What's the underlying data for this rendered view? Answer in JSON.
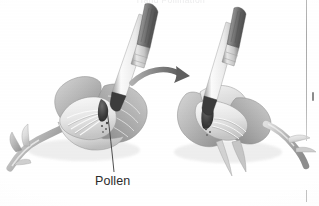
{
  "figure": {
    "medium": "grayscale scanned textbook illustration",
    "clipped_caption_top": "Hand Pollination",
    "background_color": "#ffffff",
    "ink_color": "#2b2b2b"
  },
  "labels": {
    "pollen": "Pollen"
  },
  "panels": [
    {
      "id": "left-flower",
      "name": "flower-cross-section-with-brush-collecting-pollen",
      "description": "Cut-away flower with brush inserted, stamens and pollen visible"
    },
    {
      "id": "right-flower",
      "name": "flower-cross-section-with-brush-depositing-pollen",
      "description": "Second cut-away flower receiving pollen from the brush"
    }
  ],
  "arrow": {
    "name": "transfer-arrow",
    "direction": "left-to-right",
    "color": "#8a8a8a"
  },
  "leader_line": {
    "name": "pollen-leader-line",
    "from": "pollen label",
    "to": "anther inside left flower",
    "color": "#3a3a3a"
  },
  "page_marks": {
    "rule_color": "#b4b4b4",
    "tick_color": "#6f6f6f"
  }
}
